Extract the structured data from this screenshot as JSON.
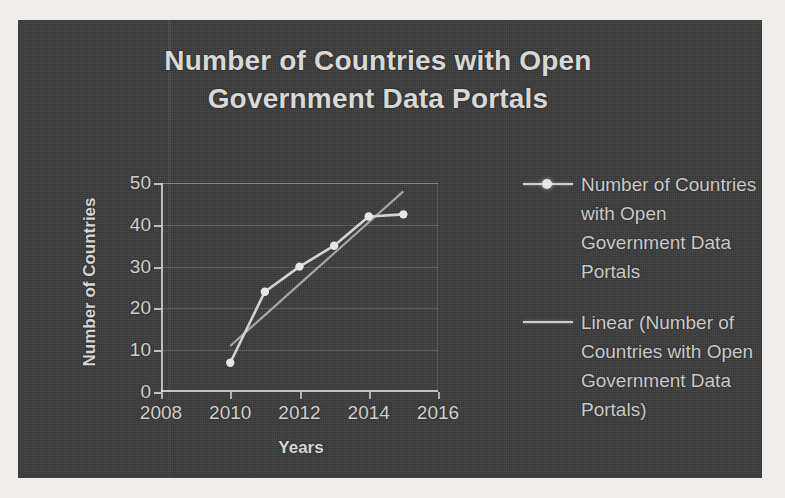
{
  "chart_data": {
    "type": "line",
    "title": "Number of Countries with Open Government Data Portals",
    "xlabel": "Years",
    "ylabel": "Number of Countries",
    "xlim": [
      2008,
      2016
    ],
    "ylim": [
      0,
      50
    ],
    "x_ticks": [
      "2008",
      "2010",
      "2012",
      "2014",
      "2016"
    ],
    "y_ticks": [
      "0",
      "10",
      "20",
      "30",
      "40",
      "50"
    ],
    "grid": true,
    "legend_position": "right",
    "x": [
      2010,
      2011,
      2012,
      2013,
      2014,
      2015
    ],
    "series": [
      {
        "name": "Number of Countries with Open Government Data Portals",
        "type": "line-with-markers",
        "values": [
          7,
          24,
          30,
          35,
          42,
          42.5
        ]
      },
      {
        "name": "Linear (Number of Countries with Open Government Data Portals)",
        "type": "trendline",
        "values": [
          11,
          18.4,
          25.8,
          33.2,
          40.6,
          48
        ]
      }
    ],
    "legend": [
      {
        "label": "Number of Countries with Open Government Data Portals",
        "symbol": "line-with-marker"
      },
      {
        "label": "Linear (Number of Countries with Open Government Data Portals)",
        "symbol": "line"
      }
    ]
  },
  "colors": {
    "background": "#3b3b3b",
    "page": "#efeeeb",
    "title_text": "#d8d8d6",
    "axis_text": "#cfcfcd",
    "series_line": "#cfcfcd",
    "marker": "#e6e6e4",
    "trendline": "#b9b9b7",
    "gridline": "#6a6a6a"
  }
}
